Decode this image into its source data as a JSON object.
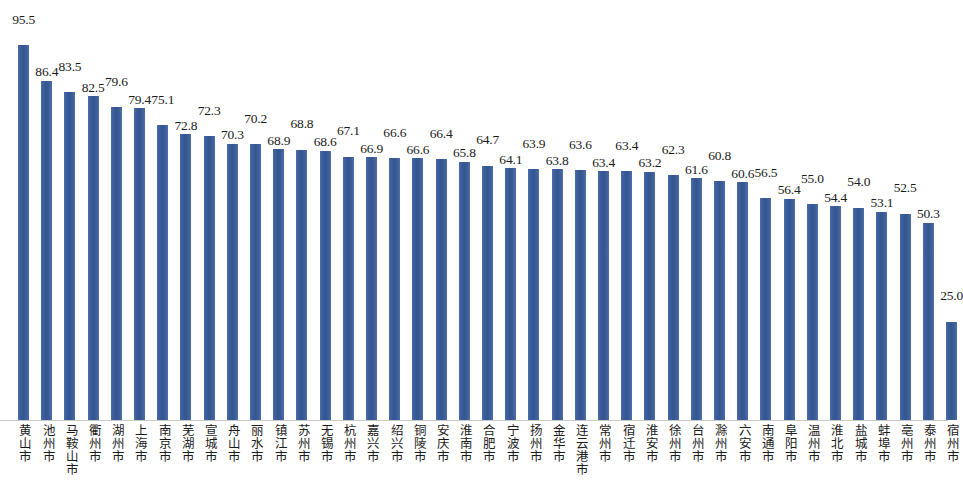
{
  "chart_data": {
    "type": "bar",
    "title": "",
    "subtitle": "",
    "xlabel": "",
    "ylabel": "",
    "ylim": [
      0,
      100
    ],
    "grid": false,
    "legend": null,
    "bar_color": "#3c5f9e",
    "axis_color": "#c8c8c8",
    "categories": [
      "黄山市",
      "池州市",
      "马鞍山市",
      "衢州市",
      "湖州市",
      "上海市",
      "南京市",
      "芜湖市",
      "宣城市",
      "舟山市",
      "丽水市",
      "镇江市",
      "苏州市",
      "无锡市",
      "杭州市",
      "嘉兴市",
      "绍兴市",
      "铜陵市",
      "安庆市",
      "淮南市",
      "合肥市",
      "宁波市",
      "扬州市",
      "金华市",
      "连云港市",
      "常州市",
      "宿迁市",
      "淮安市",
      "徐州市",
      "台州市",
      "滁州市",
      "六安市",
      "南通市",
      "阜阳市",
      "温州市",
      "淮北市",
      "盐城市",
      "蚌埠市",
      "亳州市",
      "泰州市",
      "宿州市"
    ],
    "values": [
      95.5,
      86.4,
      83.5,
      82.5,
      79.6,
      79.4,
      75.1,
      72.8,
      72.3,
      70.3,
      70.2,
      68.9,
      68.8,
      68.6,
      67.1,
      66.9,
      66.6,
      66.6,
      66.4,
      65.8,
      64.7,
      64.1,
      63.9,
      63.8,
      63.6,
      63.4,
      63.4,
      63.2,
      62.3,
      61.6,
      60.8,
      60.6,
      56.5,
      56.4,
      55.0,
      54.4,
      54.0,
      53.1,
      52.5,
      50.3,
      25.0
    ],
    "value_labels": [
      "95.5",
      "86.4",
      "83.5",
      "82.5",
      "79.6",
      "79.4",
      "75.1",
      "72.8",
      "72.3",
      "70.3",
      "70.2",
      "68.9",
      "68.8",
      "68.6",
      "67.1",
      "66.9",
      "66.6",
      "66.6",
      "66.4",
      "65.8",
      "64.7",
      "64.1",
      "63.9",
      "63.8",
      "63.6",
      "63.4",
      "63.4",
      "63.2",
      "62.3",
      "61.6",
      "60.8",
      "60.6",
      "56.5",
      "56.4",
      "55.0",
      "54.4",
      "54.0",
      "53.1",
      "52.5",
      "50.3",
      "25.0"
    ]
  }
}
